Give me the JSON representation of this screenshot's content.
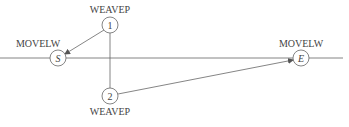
{
  "diagram": {
    "baseline": {
      "y": 58,
      "x1": 0,
      "x2": 343
    },
    "nodes": [
      {
        "id": "S",
        "label": "S",
        "italic": true,
        "cx": 58,
        "cy": 58,
        "r": 8,
        "caption": "MOVELW",
        "caption_x": 38,
        "caption_y": 47
      },
      {
        "id": "1",
        "label": "1",
        "italic": false,
        "cx": 110,
        "cy": 25,
        "r": 8,
        "caption": "WEAVEP",
        "caption_x": 110,
        "caption_y": 13
      },
      {
        "id": "2",
        "label": "2",
        "italic": false,
        "cx": 110,
        "cy": 96,
        "r": 8,
        "caption": "WEAVEP",
        "caption_x": 110,
        "caption_y": 115
      },
      {
        "id": "E",
        "label": "E",
        "italic": true,
        "cx": 301,
        "cy": 58,
        "r": 8,
        "caption": "MOVELW",
        "caption_x": 301,
        "caption_y": 47
      }
    ],
    "edges": [
      {
        "from": "1",
        "to": "S",
        "arrow": true
      },
      {
        "from": "1",
        "to": "2",
        "arrow": false
      },
      {
        "from": "2",
        "to": "E",
        "arrow": true
      }
    ]
  }
}
